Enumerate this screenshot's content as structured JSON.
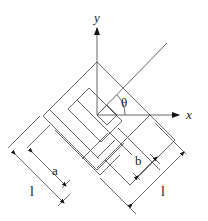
{
  "figure": {
    "axes": {
      "x_label": "x",
      "y_label": "y"
    },
    "angle_label": "θ",
    "dimensions": {
      "outer_left_label": "l",
      "inner_left_label": "a",
      "inner_right_label": "b",
      "outer_right_label": "l"
    },
    "colors": {
      "line": "#555555",
      "text": "#222222",
      "background": "#ffffff"
    }
  }
}
